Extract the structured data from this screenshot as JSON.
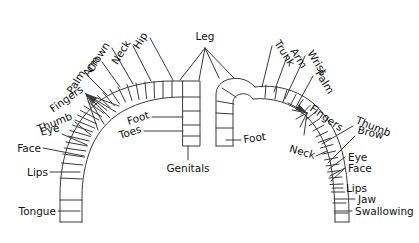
{
  "figure": {
    "name": "cortical-homunculus-diagram",
    "type": "anatomical-diagram",
    "background_color": "#ffffff",
    "ink_color": "#111111",
    "line_color": "#3a3a3a",
    "width": 419,
    "height": 243
  },
  "labels": {
    "center": {
      "leg": "Leg",
      "genitals": "Genitals"
    },
    "left_hemisphere": {
      "hip": "Hip",
      "neck": "Neck",
      "crown": "Crown",
      "arm": "Arm",
      "palm": "Palm",
      "fingers": "Fingers",
      "thumb": "Thumb",
      "eye": "Eye",
      "face": "Face",
      "lips": "Lips",
      "tongue": "Tongue",
      "foot": "Foot",
      "toes": "Toes"
    },
    "right_hemisphere": {
      "trunk": "Trunk",
      "arm": "Arm",
      "wrist": "Wrist",
      "palm": "Palm",
      "fingers": "Fingers",
      "thumb": "Thumb",
      "brow": "Brow",
      "neck": "Neck",
      "eye": "Eye",
      "face": "Face",
      "lips": "Lips",
      "jaw": "Jaw",
      "swallowing": "Swallowing",
      "foot": "Foot"
    }
  },
  "label_list_left": [
    "Fingers",
    "Palm",
    "Arm",
    "Crown",
    "Neck",
    "Hip",
    "Thumb",
    "Eye",
    "Face",
    "Lips",
    "Tongue",
    "Foot",
    "Toes"
  ],
  "label_list_right": [
    "Trunk",
    "Arm",
    "Wrist",
    "Palm",
    "Fingers",
    "Thumb",
    "Brow",
    "Neck",
    "Eye",
    "Face",
    "Lips",
    "Jaw",
    "Swallowing",
    "Foot"
  ]
}
